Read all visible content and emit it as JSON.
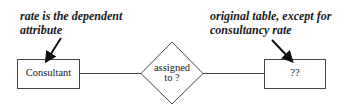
{
  "diagram": {
    "type": "entity-relationship",
    "entities": [
      {
        "id": "consultant",
        "label": "Consultant"
      },
      {
        "id": "unknown",
        "label": "??"
      }
    ],
    "relationship": {
      "label_line1": "assigned",
      "label_line2": "to ?"
    },
    "annotations": [
      {
        "target": "consultant",
        "line1": "rate is the dependent",
        "line2": "attribute"
      },
      {
        "target": "unknown",
        "line1": "original table, except for",
        "line2": "consultancy rate"
      }
    ],
    "colors": {
      "stroke": "#333333",
      "text": "#1a1a1a",
      "background": "#ffffff"
    }
  }
}
